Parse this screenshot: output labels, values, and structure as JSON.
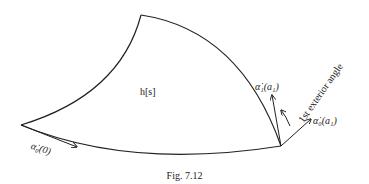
{
  "figure": {
    "caption": "Fig. 7.12",
    "region_label": "h[s]",
    "labels": {
      "alpha0_at_0": "α̇₀(0)",
      "alpha1_at_a1": "α̇₁(a₁)",
      "alpha0_at_a1": "α̇₀(a₁)",
      "exterior_angle": "1st exterior angle"
    },
    "stroke_color": "#222222"
  }
}
